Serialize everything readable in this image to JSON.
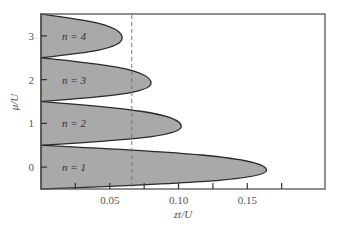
{
  "chart_data": {
    "type": "area",
    "title": "",
    "xlabel": "zt/U",
    "ylabel": "μ/U",
    "xlim": [
      0,
      0.2065
    ],
    "ylim": [
      -0.5,
      3.5
    ],
    "grid": false,
    "legend": null,
    "x_ticks": {
      "labeled": [
        {
          "value": 0.05,
          "label": "0.05"
        },
        {
          "value": 0.1,
          "label": "0.10"
        },
        {
          "value": 0.15,
          "label": "0.15"
        }
      ],
      "minor": [
        0.025,
        0.075,
        0.125,
        0.175
      ]
    },
    "y_ticks": [
      {
        "value": 0,
        "label": "0"
      },
      {
        "value": 1,
        "label": "1"
      },
      {
        "value": 2,
        "label": "2"
      },
      {
        "value": 3,
        "label": "3"
      }
    ],
    "series": [
      {
        "name": "n = 1",
        "mu_lower": -0.5,
        "mu_upper": 0.5,
        "tip_zt": 0.164,
        "tip_mu": -0.07
      },
      {
        "name": "n = 2",
        "mu_lower": 0.5,
        "mu_upper": 1.5,
        "tip_zt": 0.102,
        "tip_mu": 0.93
      },
      {
        "name": "n = 3",
        "mu_lower": 1.5,
        "mu_upper": 2.5,
        "tip_zt": 0.08,
        "tip_mu": 1.92
      },
      {
        "name": "n = 4",
        "mu_lower": 2.5,
        "mu_upper": 3.5,
        "tip_zt": 0.059,
        "tip_mu": 2.95
      }
    ],
    "annotations": [
      {
        "type": "vline",
        "x": 0.066,
        "style": "dashed"
      }
    ],
    "fill_color": "#a9a9a9",
    "edge_color": "#2a2a2a"
  }
}
